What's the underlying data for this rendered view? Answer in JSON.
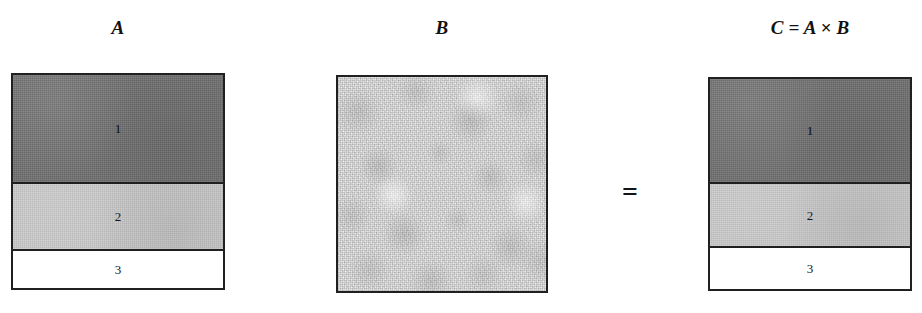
{
  "figure": {
    "type": "diagram",
    "operator": "="
  },
  "matrices": [
    {
      "id": "A",
      "caption": "A",
      "fill": "banded",
      "bands": [
        {
          "label": "1",
          "shade": "dark",
          "color": "#6f6f6f"
        },
        {
          "label": "2",
          "shade": "light",
          "color": "#c9c9c9"
        },
        {
          "label": "3",
          "shade": "white",
          "color": "#ffffff"
        }
      ]
    },
    {
      "id": "B",
      "caption": "B",
      "fill": "noise",
      "color": "#ededed",
      "bands": []
    },
    {
      "id": "C",
      "caption": "C = A × B",
      "fill": "banded",
      "bands": [
        {
          "label": "1",
          "shade": "dark",
          "color": "#6f6f6f"
        },
        {
          "label": "2",
          "shade": "light",
          "color": "#c9c9c9"
        },
        {
          "label": "3",
          "shade": "white",
          "color": "#ffffff"
        }
      ]
    }
  ],
  "colors": {
    "border": "#202020",
    "dark_band": "#6f6f6f",
    "light_band": "#c9c9c9",
    "white_band": "#ffffff",
    "noise_base": "#ededed",
    "text": "#141414",
    "background": "#ffffff"
  }
}
